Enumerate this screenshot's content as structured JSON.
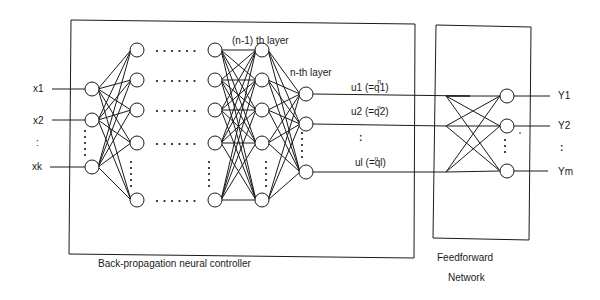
{
  "diagram": {
    "inputs": [
      "x1",
      "x2",
      ":",
      "xk"
    ],
    "layer_labels": {
      "n_minus_1": "(n-1) th layer",
      "n": "n-th layer"
    },
    "signals": [
      {
        "label": "u1 (=q1)",
        "superscript": "n"
      },
      {
        "label": "u2 (=q2)",
        "superscript": "n"
      },
      {
        "label": ":"
      },
      {
        "label": "ul (=ql)",
        "superscript": "n"
      }
    ],
    "outputs": [
      "Y1",
      "Y2",
      ":",
      "Ym"
    ],
    "captions": {
      "controller": "Back-propagation neural controller",
      "feedforward_line1": "Feedforward",
      "feedforward_line2": "Network"
    },
    "ellipsis": "......",
    "colors": {
      "line": "#1a1a1a",
      "background": "#ffffff"
    }
  }
}
